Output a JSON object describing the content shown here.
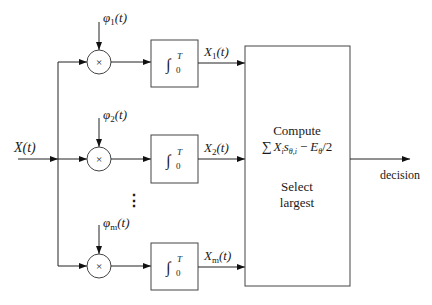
{
  "diagram": {
    "type": "correlator-receiver-block-diagram",
    "input": {
      "label": "X(t)"
    },
    "branches": [
      {
        "reference": "φ",
        "reference_sub": "1",
        "reference_arg": "(t)",
        "multiplier_symbol": "×",
        "integrator": {
          "symbol": "∫",
          "lower": "0",
          "upper": "T"
        },
        "output": "X",
        "output_sub": "1",
        "output_arg": "(t)"
      },
      {
        "reference": "φ",
        "reference_sub": "2",
        "reference_arg": "(t)",
        "multiplier_symbol": "×",
        "integrator": {
          "symbol": "∫",
          "lower": "0",
          "upper": "T"
        },
        "output": "X",
        "output_sub": "2",
        "output_arg": "(t)"
      },
      {
        "reference": "φ",
        "reference_sub": "m",
        "reference_arg": "(t)",
        "multiplier_symbol": "×",
        "integrator": {
          "symbol": "∫",
          "lower": "0",
          "upper": "T"
        },
        "output": "X",
        "output_sub": "m",
        "output_arg": "(t)"
      }
    ],
    "ellipsis": "⋮",
    "decision_block": {
      "line1": "Compute",
      "formula": {
        "sum": "∑",
        "term1": "X",
        "term1_sub": "i",
        "term2": "s",
        "term2_sub": "θ,i",
        "minus": "−",
        "term3": "E",
        "term3_sub": "θ",
        "tail": "/2"
      },
      "line3": "Select",
      "line4": "largest"
    },
    "output": {
      "label": "decision"
    }
  }
}
